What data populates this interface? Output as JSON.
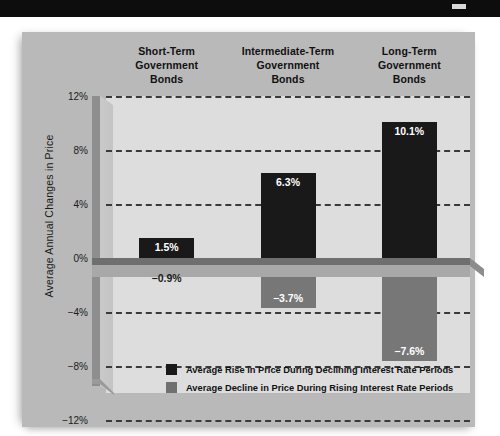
{
  "banner": {
    "mark": ""
  },
  "chart_data": {
    "type": "bar",
    "title": "",
    "xlabel": "",
    "ylabel": "Average Annual Changes in Price",
    "categories": [
      "Short-Term\nGovernment\nBonds",
      "Intermediate-Term\nGovernment\nBonds",
      "Long-Term\nGovernment\nBonds"
    ],
    "category_lines": [
      [
        "Short-Term",
        "Government",
        "Bonds"
      ],
      [
        "Intermediate-Term",
        "Government",
        "Bonds"
      ],
      [
        "Long-Term",
        "Government",
        "Bonds"
      ]
    ],
    "series": [
      {
        "name": "Average  Rise in Price During Declining Interest Rate Periods",
        "color": "#191919",
        "values": [
          1.5,
          6.3,
          10.1
        ],
        "labels": [
          "1.5%",
          "6.3%",
          "10.1%"
        ]
      },
      {
        "name": "Average  Decline in Price During Rising Interest Rate Periods",
        "color": "#777777",
        "values": [
          -0.9,
          -3.7,
          -7.6
        ],
        "labels": [
          "−0.9%",
          "−3.7%",
          "−7.6%"
        ]
      }
    ],
    "ylim": [
      -12,
      12
    ],
    "yticks": [
      12,
      8,
      4,
      0,
      -4,
      -8,
      -12
    ],
    "ytick_labels": [
      "12%",
      "8%",
      "4%",
      "0%",
      "−4%",
      "−8%",
      "−12%"
    ],
    "grid": true,
    "grid_style": "dashed",
    "legend_position": "inside-bottom-center"
  },
  "legend": {
    "items": [
      {
        "swatch": "black",
        "label": "Average  Rise in Price During Declining Interest Rate Periods"
      },
      {
        "swatch": "gray",
        "label": "Average  Decline in Price During Rising Interest Rate Periods"
      }
    ]
  },
  "colors": {
    "banner": "#0d0d0d",
    "card": "#b9b9b9",
    "plot": "#dddddd",
    "bar_positive": "#191919",
    "bar_negative": "#777777",
    "zero_slab_top": "#6f6f6f",
    "zero_slab_front": "#a8a8a8",
    "gridline": "#3a3a3a"
  }
}
